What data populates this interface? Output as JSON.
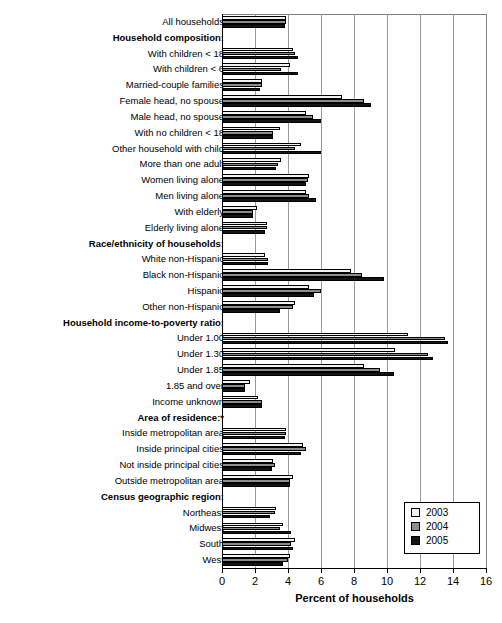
{
  "chart_data": {
    "type": "bar",
    "orientation": "horizontal",
    "title": "",
    "xlabel": "Percent of households",
    "ylabel": "",
    "xlim": [
      0,
      16
    ],
    "xticks": [
      0,
      2,
      4,
      6,
      8,
      10,
      12,
      14,
      16
    ],
    "grid": true,
    "legend_position": "bottom-right",
    "legend": [
      "2003",
      "2004",
      "2005"
    ],
    "series": [
      {
        "name": "2003",
        "color": "#f2f2f2"
      },
      {
        "name": "2004",
        "color": "#8c8c8c"
      },
      {
        "name": "2005",
        "color": "#141414"
      }
    ],
    "rows": [
      {
        "label": "All households",
        "header": false,
        "values": [
          3.9,
          3.9,
          3.8
        ]
      },
      {
        "label": "Household composition:",
        "header": true,
        "values": null
      },
      {
        "label": "With children < 18",
        "header": false,
        "values": [
          4.3,
          4.4,
          4.6
        ]
      },
      {
        "label": "With children < 6",
        "header": false,
        "values": [
          4.1,
          3.6,
          4.6
        ]
      },
      {
        "label": "Married-couple families",
        "header": false,
        "values": [
          2.4,
          2.4,
          2.3
        ]
      },
      {
        "label": "Female head, no spouse",
        "header": false,
        "values": [
          7.3,
          8.6,
          9.0
        ]
      },
      {
        "label": "Male head, no spouse",
        "header": false,
        "values": [
          5.1,
          5.5,
          6.0
        ]
      },
      {
        "label": "With no children < 18",
        "header": false,
        "values": [
          3.5,
          3.1,
          3.1
        ]
      },
      {
        "label": "Other household with child",
        "header": false,
        "values": [
          4.8,
          4.4,
          6.0
        ]
      },
      {
        "label": "More than one adult",
        "header": false,
        "values": [
          3.6,
          3.4,
          3.3
        ]
      },
      {
        "label": "Women living alone",
        "header": false,
        "values": [
          5.3,
          5.2,
          5.1
        ]
      },
      {
        "label": "Men living alone",
        "header": false,
        "values": [
          5.1,
          5.3,
          5.7
        ]
      },
      {
        "label": "With elderly",
        "header": false,
        "values": [
          2.1,
          1.9,
          1.9
        ]
      },
      {
        "label": "Elderly living alone",
        "header": false,
        "values": [
          2.7,
          2.7,
          2.6
        ]
      },
      {
        "label": "Race/ethnicity of households:",
        "header": true,
        "values": null
      },
      {
        "label": "White non-Hispanic",
        "header": false,
        "values": [
          2.6,
          2.8,
          2.8
        ]
      },
      {
        "label": "Black non-Hispanic",
        "header": false,
        "values": [
          7.8,
          8.5,
          9.8
        ]
      },
      {
        "label": "Hispanic",
        "header": false,
        "values": [
          5.3,
          6.0,
          5.6
        ]
      },
      {
        "label": "Other non-Hispanic",
        "header": false,
        "values": [
          4.4,
          4.3,
          3.5
        ]
      },
      {
        "label": "Household income-to-poverty ratio:",
        "header": true,
        "values": null
      },
      {
        "label": "Under 1.00",
        "header": false,
        "values": [
          11.3,
          13.5,
          13.7
        ]
      },
      {
        "label": "Under 1.30",
        "header": false,
        "values": [
          10.5,
          12.5,
          12.8
        ]
      },
      {
        "label": "Under 1.85",
        "header": false,
        "values": [
          8.6,
          9.6,
          10.4
        ]
      },
      {
        "label": "1.85 and over",
        "header": false,
        "values": [
          1.7,
          1.4,
          1.4
        ]
      },
      {
        "label": "Income unknown",
        "header": false,
        "values": [
          2.2,
          2.4,
          2.4
        ]
      },
      {
        "label": "Area of residence:*",
        "header": true,
        "values": null
      },
      {
        "label": "Inside metropolitan area",
        "header": false,
        "values": [
          3.9,
          3.9,
          3.8
        ]
      },
      {
        "label": "Inside principal cities",
        "header": false,
        "values": [
          4.9,
          5.1,
          4.8
        ]
      },
      {
        "label": "Not inside principal cities",
        "header": false,
        "values": [
          3.1,
          3.2,
          3.0
        ]
      },
      {
        "label": "Outside metropolitan area",
        "header": false,
        "values": [
          4.3,
          4.1,
          4.1
        ]
      },
      {
        "label": "Census geographic region:",
        "header": true,
        "values": null
      },
      {
        "label": "Northeast",
        "header": false,
        "values": [
          3.3,
          3.2,
          2.9
        ]
      },
      {
        "label": "Midwest",
        "header": false,
        "values": [
          3.7,
          3.5,
          4.2
        ]
      },
      {
        "label": "South",
        "header": false,
        "values": [
          4.4,
          4.2,
          4.3
        ]
      },
      {
        "label": "West",
        "header": false,
        "values": [
          4.1,
          4.0,
          3.7
        ]
      }
    ]
  }
}
